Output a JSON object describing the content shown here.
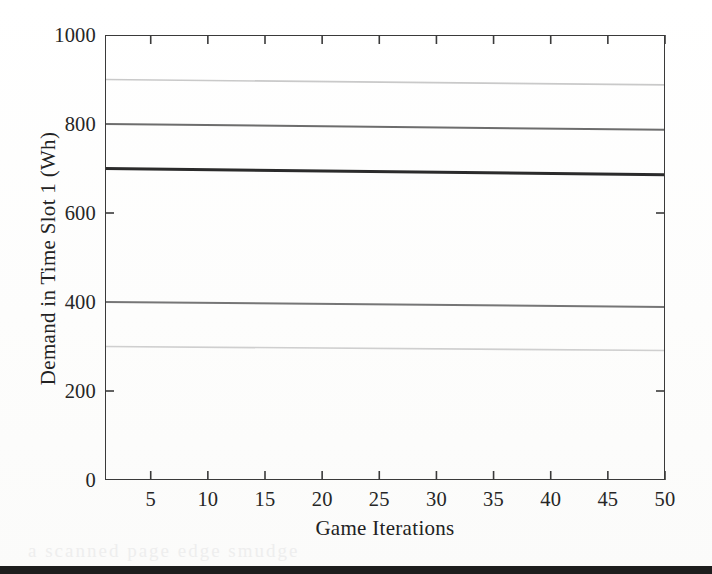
{
  "chart_data": {
    "type": "line",
    "title": "",
    "subtitle": "",
    "xlabel": "Game Iterations",
    "ylabel": "Demand in Time Slot 1 (Wh)",
    "xlim": [
      1,
      50
    ],
    "ylim": [
      0,
      1000
    ],
    "grid": false,
    "legend": "none",
    "x_ticks": [
      5,
      10,
      15,
      20,
      25,
      30,
      35,
      40,
      45,
      50
    ],
    "x_tick_labels": [
      "5",
      "10",
      "15",
      "20",
      "25",
      "30",
      "35",
      "40",
      "45",
      "50"
    ],
    "y_ticks": [
      0,
      200,
      400,
      600,
      800,
      1000
    ],
    "y_tick_labels": [
      "0",
      "200",
      "400",
      "600",
      "800",
      "1000"
    ],
    "y_labeled_ticks": [
      0,
      200,
      400,
      600,
      800,
      1000
    ],
    "x": [
      1,
      50
    ],
    "series": [
      {
        "name": "household-5",
        "color": "#c9c9c9",
        "width": 1.6,
        "start_value": 900,
        "end_value": 888,
        "values": [
          900,
          888
        ]
      },
      {
        "name": "household-4",
        "color": "#6d6d6d",
        "width": 2.0,
        "start_value": 800,
        "end_value": 787,
        "values": [
          800,
          787
        ]
      },
      {
        "name": "household-3",
        "color": "#2b2b2b",
        "width": 3.0,
        "start_value": 700,
        "end_value": 686,
        "values": [
          700,
          686
        ]
      },
      {
        "name": "household-2",
        "color": "#767676",
        "width": 2.0,
        "start_value": 400,
        "end_value": 389,
        "values": [
          400,
          389
        ]
      },
      {
        "name": "household-1",
        "color": "#cfcfcf",
        "width": 1.6,
        "start_value": 300,
        "end_value": 291,
        "values": [
          300,
          291
        ]
      }
    ]
  },
  "axes": {
    "frame_color": "#3a3a3a",
    "tick_color": "#3a3a3a",
    "tick_length": 9,
    "y_inner_ticks_at": [
      200,
      600
    ],
    "x_top_ticks": [
      5,
      10,
      15,
      20,
      25,
      30,
      35,
      40,
      45,
      50
    ]
  },
  "artifacts": {
    "bottom_bar_color": "#1d1d1d",
    "ghost_text": "a scanned page edge smudge"
  }
}
